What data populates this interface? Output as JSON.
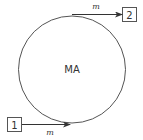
{
  "diagram": {
    "center": {
      "label": "MA"
    },
    "nodes": [
      {
        "id": "node-1",
        "label": "1"
      },
      {
        "id": "node-2",
        "label": "2"
      }
    ],
    "flows": [
      {
        "from": "1",
        "to": "MA",
        "label": "m"
      },
      {
        "from": "MA",
        "to": "2",
        "label": "m"
      }
    ],
    "colors": {
      "stroke": "#333333",
      "background": "#ffffff"
    }
  }
}
